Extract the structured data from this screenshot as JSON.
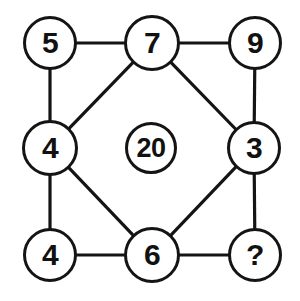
{
  "canvas": {
    "width": 300,
    "height": 301,
    "background_color": "#ffffff",
    "stroke_color": "#141414",
    "text_color": "#111111",
    "node_stroke_width": 3.4,
    "edge_stroke_width": 3.2
  },
  "diagram": {
    "type": "number-puzzle-graph",
    "title": "",
    "nodes": [
      {
        "id": "top-left",
        "label": "5",
        "cx": 50,
        "cy": 43,
        "r": 27,
        "font_size": 30,
        "is_answer_slot": false
      },
      {
        "id": "top-center",
        "label": "7",
        "cx": 152,
        "cy": 43,
        "r": 28,
        "font_size": 30,
        "is_answer_slot": false
      },
      {
        "id": "top-right",
        "label": "9",
        "cx": 255,
        "cy": 43,
        "r": 27,
        "font_size": 30,
        "is_answer_slot": false
      },
      {
        "id": "middle-left",
        "label": "4",
        "cx": 50,
        "cy": 148,
        "r": 28,
        "font_size": 30,
        "is_answer_slot": false
      },
      {
        "id": "center",
        "label": "20",
        "cx": 151,
        "cy": 148,
        "r": 26,
        "font_size": 27,
        "is_answer_slot": false
      },
      {
        "id": "middle-right",
        "label": "3",
        "cx": 254,
        "cy": 148,
        "r": 27,
        "font_size": 30,
        "is_answer_slot": false
      },
      {
        "id": "bottom-left",
        "label": "4",
        "cx": 50,
        "cy": 255,
        "r": 27,
        "font_size": 30,
        "is_answer_slot": false
      },
      {
        "id": "bottom-center",
        "label": "6",
        "cx": 152,
        "cy": 255,
        "r": 28,
        "font_size": 30,
        "is_answer_slot": false
      },
      {
        "id": "bottom-right",
        "label": "?",
        "cx": 255,
        "cy": 255,
        "r": 27,
        "font_size": 30,
        "is_answer_slot": true
      }
    ],
    "edges": [
      {
        "from": "top-left",
        "to": "top-center",
        "kind": "horizontal"
      },
      {
        "from": "top-center",
        "to": "top-right",
        "kind": "horizontal"
      },
      {
        "from": "top-left",
        "to": "middle-left",
        "kind": "vertical"
      },
      {
        "from": "middle-left",
        "to": "bottom-left",
        "kind": "vertical"
      },
      {
        "from": "top-right",
        "to": "middle-right",
        "kind": "vertical"
      },
      {
        "from": "middle-right",
        "to": "bottom-right",
        "kind": "vertical"
      },
      {
        "from": "bottom-left",
        "to": "bottom-center",
        "kind": "horizontal"
      },
      {
        "from": "bottom-center",
        "to": "bottom-right",
        "kind": "horizontal"
      },
      {
        "from": "top-center",
        "to": "middle-left",
        "kind": "diagonal"
      },
      {
        "from": "top-center",
        "to": "middle-right",
        "kind": "diagonal"
      },
      {
        "from": "middle-left",
        "to": "bottom-center",
        "kind": "diagonal"
      },
      {
        "from": "middle-right",
        "to": "bottom-center",
        "kind": "diagonal"
      }
    ]
  }
}
